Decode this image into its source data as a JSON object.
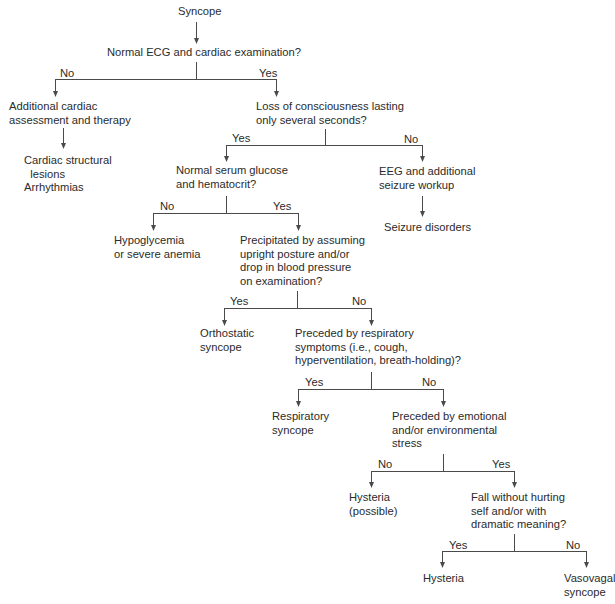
{
  "diagram": {
    "type": "flowchart",
    "root": "Syncope",
    "nodes": {
      "syncope": "Syncope",
      "ecg_question": "Normal ECG and cardiac examination?",
      "cardiac_assessment": "Additional cardiac\nassessment and therapy",
      "cardiac_outcomes": "Cardiac structural\n  lesions\nArrhythmias",
      "loc_question": "Loss of consciousness lasting\nonly several seconds?",
      "glucose_question": "Normal serum glucose\nand hematocrit?",
      "eeg_workup": "EEG and additional\nseizure workup",
      "seizure_disorders": "Seizure disorders",
      "hypoglycemia": "Hypoglycemia\nor severe anemia",
      "posture_question": "Precipitated by assuming\nupright posture and/or\ndrop in blood pressure\non examination?",
      "orthostatic": "Orthostatic\nsyncope",
      "respiratory_question": "Preceded by respiratory\nsymptoms (i.e., cough,\nhyperventilation, breath-holding)?",
      "respiratory_syncope": "Respiratory\nsyncope",
      "stress_question": "Preceded by emotional\nand/or environmental\nstress",
      "hysteria_possible": "Hysteria\n(possible)",
      "fall_question": "Fall without hurting\nself and/or with\ndramatic meaning?",
      "hysteria": "Hysteria",
      "vasovagal": "Vasovagal\nsyncope"
    },
    "branch_labels": {
      "ecg_no": "No",
      "ecg_yes": "Yes",
      "loc_yes": "Yes",
      "loc_no": "No",
      "glucose_no": "No",
      "glucose_yes": "Yes",
      "posture_yes": "Yes",
      "posture_no": "No",
      "respiratory_yes": "Yes",
      "respiratory_no": "No",
      "stress_no": "No",
      "stress_yes": "Yes",
      "fall_yes": "Yes",
      "fall_no": "No"
    },
    "edges": [
      {
        "from": "syncope",
        "to": "ecg_question",
        "label": ""
      },
      {
        "from": "ecg_question",
        "to": "cardiac_assessment",
        "label": "No"
      },
      {
        "from": "ecg_question",
        "to": "loc_question",
        "label": "Yes"
      },
      {
        "from": "cardiac_assessment",
        "to": "cardiac_outcomes",
        "label": ""
      },
      {
        "from": "loc_question",
        "to": "glucose_question",
        "label": "Yes"
      },
      {
        "from": "loc_question",
        "to": "eeg_workup",
        "label": "No"
      },
      {
        "from": "eeg_workup",
        "to": "seizure_disorders",
        "label": ""
      },
      {
        "from": "glucose_question",
        "to": "hypoglycemia",
        "label": "No"
      },
      {
        "from": "glucose_question",
        "to": "posture_question",
        "label": "Yes"
      },
      {
        "from": "posture_question",
        "to": "orthostatic",
        "label": "Yes"
      },
      {
        "from": "posture_question",
        "to": "respiratory_question",
        "label": "No"
      },
      {
        "from": "respiratory_question",
        "to": "respiratory_syncope",
        "label": "Yes"
      },
      {
        "from": "respiratory_question",
        "to": "stress_question",
        "label": "No"
      },
      {
        "from": "stress_question",
        "to": "hysteria_possible",
        "label": "No"
      },
      {
        "from": "stress_question",
        "to": "fall_question",
        "label": "Yes"
      },
      {
        "from": "fall_question",
        "to": "hysteria",
        "label": "Yes"
      },
      {
        "from": "fall_question",
        "to": "vasovagal",
        "label": "No"
      }
    ],
    "colors": {
      "text": "#2b2b2b",
      "lines": "#4a4a4a",
      "background": "#ffffff"
    }
  }
}
